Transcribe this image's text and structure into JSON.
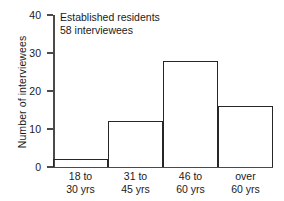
{
  "chart_data": {
    "type": "bar",
    "title": "",
    "subtitle": "",
    "xlabel": "",
    "ylabel": "Number of interviewees",
    "categories": [
      "18 to 30 yrs",
      "31 to 45 yrs",
      "46 to 60 yrs",
      "over 60 yrs"
    ],
    "category_lines": [
      [
        "18 to",
        "30 yrs"
      ],
      [
        "31 to",
        "45 yrs"
      ],
      [
        "46 to",
        "60 yrs"
      ],
      [
        "over",
        "60 yrs"
      ]
    ],
    "values": [
      2,
      12,
      28,
      16
    ],
    "ylim": [
      0,
      40
    ],
    "yticks": [
      0,
      10,
      20,
      30,
      40
    ],
    "ytick_labels": [
      "0",
      "10",
      "20",
      "30",
      "40"
    ],
    "grid": false,
    "legend": "none",
    "annotations": [
      "Established residents",
      "58 interviewees"
    ],
    "colors": {
      "bar_outline": "#262626",
      "bar_fill": "transparent",
      "axis": "#4a4a4a",
      "text": "#1a1a1a",
      "background": "#ffffff"
    }
  },
  "top_caption_fragment": ""
}
